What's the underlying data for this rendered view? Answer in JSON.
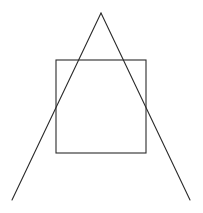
{
  "diagram": {
    "stroke_color": "#2b2b2b",
    "stroke_width": 1.1,
    "square": {
      "x": 56,
      "y": 60,
      "width": 90,
      "height": 93
    },
    "triangle": {
      "apex": {
        "x": 101,
        "y": 13
      },
      "left_end": {
        "x": 12,
        "y": 200
      },
      "right_end": {
        "x": 190,
        "y": 200
      },
      "has_base": false
    }
  }
}
